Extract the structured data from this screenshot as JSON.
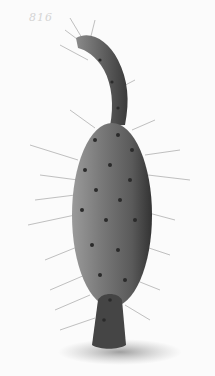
{
  "image": {
    "subject": "Prickly pear cactus pad (Opuntia) botanical illustration",
    "plate_number": "816",
    "colors": {
      "background": "#fbfbfb",
      "pad_dark": "#3a3a3a",
      "pad_mid": "#6e6e6e",
      "pad_light": "#9a9a9a",
      "spine": "#555555",
      "shadow": "#8c8c8c"
    }
  }
}
